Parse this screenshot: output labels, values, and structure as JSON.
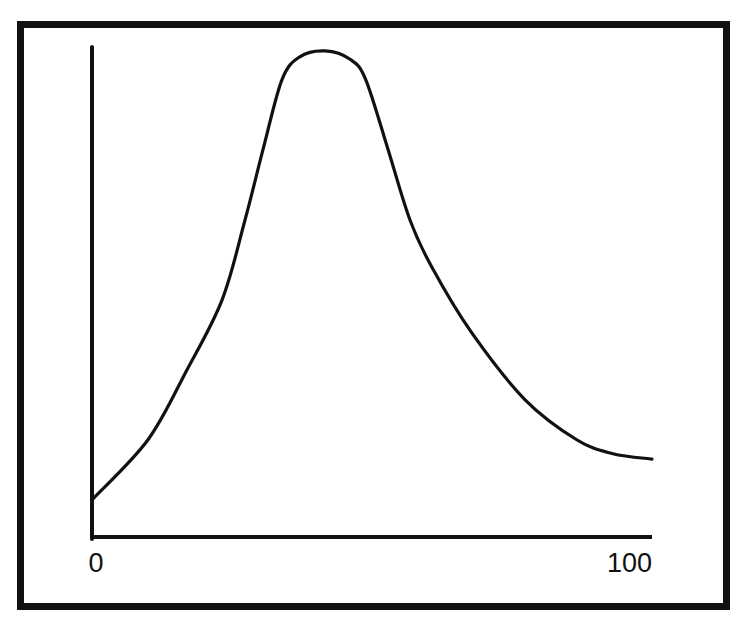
{
  "colors": {
    "background": "#ffffff",
    "ink": "#111111"
  },
  "axes": {
    "x_tick_min_label": "0",
    "x_tick_max_label": "100"
  },
  "chart_data": {
    "type": "line",
    "title": "",
    "xlabel": "",
    "ylabel": "",
    "xlim": [
      0,
      100
    ],
    "ylim": [
      0,
      100
    ],
    "grid": false,
    "legend": null,
    "x_tick_labels": [
      "0",
      "100"
    ],
    "y_tick_labels": [],
    "series": [
      {
        "name": "curve",
        "x": [
          0,
          9.8,
          16.8,
          23.1,
          27.2,
          30.4,
          33.8,
          37.0,
          41.5,
          46.0,
          48.8,
          52.8,
          56.7,
          60.6,
          67.8,
          77.3,
          86.6,
          93.0,
          100
        ],
        "y": [
          7.8,
          19.8,
          34.1,
          48.4,
          64.7,
          79.0,
          93.3,
          98.0,
          99.2,
          97.5,
          93.3,
          79.0,
          64.7,
          55.1,
          41.6,
          28.0,
          19.8,
          17.0,
          15.9
        ]
      }
    ]
  }
}
